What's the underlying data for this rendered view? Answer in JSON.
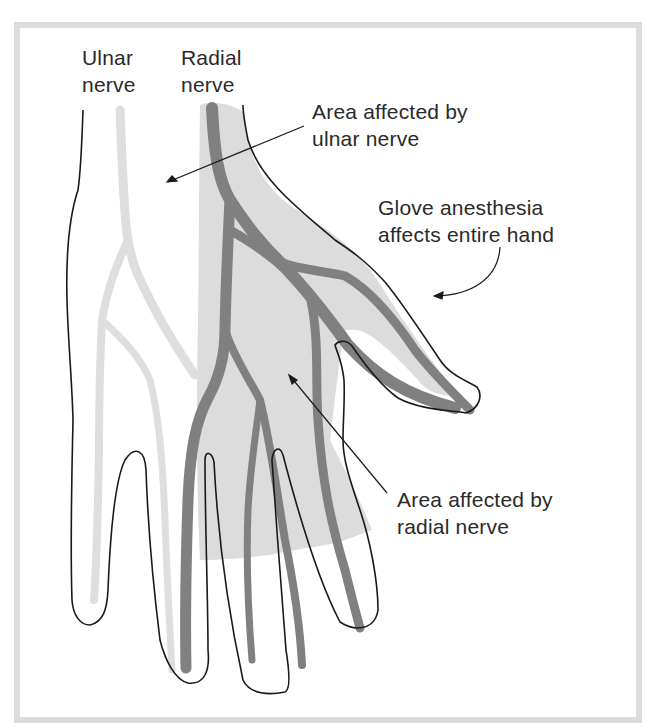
{
  "figure": {
    "colors": {
      "frame": "#dcdcdc",
      "ulnar_nerve": "#dedede",
      "radial_area": "#dcdcdc",
      "radial_nerve": "#808080",
      "outline": "#1a1a1a",
      "text": "#2a2a2a"
    }
  },
  "labels": {
    "ulnar_nerve": {
      "line1": "Ulnar",
      "line2": "nerve"
    },
    "radial_nerve": {
      "line1": "Radial",
      "line2": "nerve"
    },
    "ulnar_area": {
      "line1": "Area affected by",
      "line2": "ulnar nerve"
    },
    "glove": {
      "line1": "Glove anesthesia",
      "line2": "affects entire hand"
    },
    "radial_area": {
      "line1": "Area affected by",
      "line2": "radial nerve"
    }
  }
}
